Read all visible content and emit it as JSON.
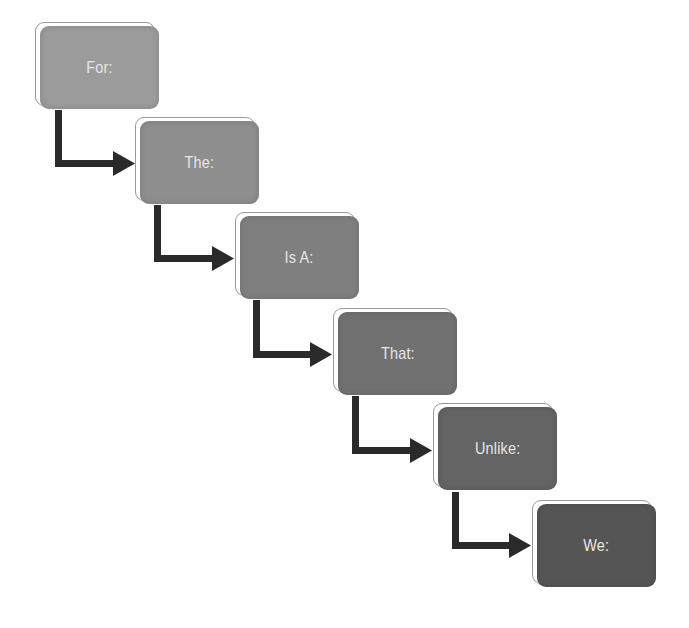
{
  "diagram": {
    "type": "flow-steps",
    "steps": [
      {
        "label": "For:",
        "color": "#9b9b9b",
        "x": 35,
        "y": 22
      },
      {
        "label": "The:",
        "color": "#8e8e8e",
        "x": 135,
        "y": 117
      },
      {
        "label": "Is A:",
        "color": "#7f7f7f",
        "x": 235,
        "y": 212
      },
      {
        "label": "That:",
        "color": "#717171",
        "x": 333,
        "y": 308
      },
      {
        "label": "Unlike:",
        "color": "#646464",
        "x": 433,
        "y": 403
      },
      {
        "label": "We:",
        "color": "#555555",
        "x": 532,
        "y": 500
      }
    ],
    "arrow_color": "#2a2a2a",
    "outline_color": "#9a9a9a"
  }
}
